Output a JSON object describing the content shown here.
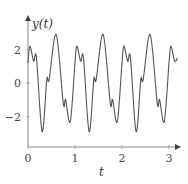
{
  "chart_data": {
    "type": "line",
    "title": "",
    "xlabel": "t",
    "ylabel": "y(t)",
    "xlim": [
      0,
      3.2
    ],
    "ylim": [
      -3.1,
      3.1
    ],
    "xticks": [
      0,
      1,
      2,
      3
    ],
    "yticks": [
      -2,
      0,
      2
    ],
    "xtick_labels": [
      "0",
      "1",
      "2",
      "3"
    ],
    "ytick_labels": [
      "−2",
      "0",
      "2"
    ],
    "grid": false,
    "legend": null,
    "period": 1.0,
    "series": [
      {
        "name": "y(t)",
        "color": "#555555",
        "x": [
          0,
          0.04,
          0.12,
          0.18,
          0.3,
          0.4,
          0.45,
          0.6,
          0.75,
          0.8,
          0.9,
          1.0,
          1.04,
          1.12,
          1.18,
          1.3,
          1.4,
          1.45,
          1.6,
          1.75,
          1.8,
          1.9,
          2.0,
          2.04,
          2.12,
          2.18,
          2.3,
          2.4,
          2.45,
          2.6,
          2.75,
          2.8,
          2.9,
          3.0,
          3.04,
          3.12,
          3.18
        ],
        "values": [
          1.2,
          2.2,
          1.3,
          1.5,
          -2.9,
          0.2,
          0.2,
          2.9,
          -1.2,
          -1.0,
          -2.3,
          1.2,
          2.2,
          1.3,
          1.5,
          -2.9,
          0.2,
          0.2,
          2.9,
          -1.2,
          -1.0,
          -2.3,
          1.2,
          2.2,
          1.3,
          1.5,
          -2.9,
          0.2,
          0.2,
          2.9,
          -1.2,
          -1.0,
          -2.3,
          1.2,
          2.2,
          1.3,
          1.5
        ]
      }
    ]
  }
}
